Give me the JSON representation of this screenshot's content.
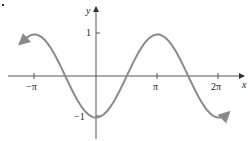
{
  "chart_data": {
    "type": "line",
    "title": "",
    "function": "y = -cos(x)",
    "xlabel": "x",
    "ylabel": "y",
    "xlim": [
      -3.77,
      4.25
    ],
    "ylim": [
      -1.3,
      1.5
    ],
    "x_ticks": [
      "−π",
      "π",
      "2π"
    ],
    "y_ticks": [
      "1",
      "−1"
    ],
    "grid": false,
    "legend": null,
    "series": [
      {
        "name": "y = -cos x",
        "color": "#8a8a8a",
        "x": [
          -3.6,
          -3.1416,
          -1.5708,
          0,
          1.5708,
          3.1416,
          4.7124,
          6.2832,
          6.8
        ],
        "y": [
          0.896,
          1,
          0,
          -1,
          0,
          1,
          0,
          -1,
          -0.87
        ]
      }
    ]
  },
  "labels": {
    "x_axis": "x",
    "y_axis": "y",
    "tick_neg_pi": "−π",
    "tick_pi": "π",
    "tick_2pi": "2π",
    "tick_pos1": "1",
    "tick_neg1": "−1"
  }
}
